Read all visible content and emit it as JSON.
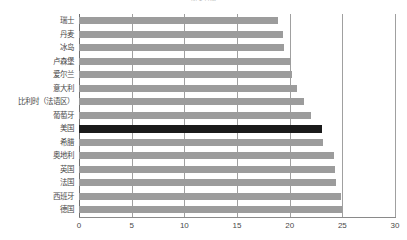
{
  "chart_data": {
    "type": "bar",
    "orientation": "horizontal",
    "title": "图 1 各国",
    "xlabel": "",
    "ylabel": "",
    "xlim": [
      0,
      30
    ],
    "ylim": null,
    "grid": true,
    "legend": null,
    "xticks": [
      0,
      5,
      10,
      15,
      20,
      25,
      30
    ],
    "xtick_labels": [
      "0",
      "5",
      "10",
      "15",
      "20",
      "25",
      "30"
    ],
    "categories": [
      "瑞士",
      "丹麦",
      "冰岛",
      "卢森堡",
      "爱尔兰",
      "意大利",
      "比利时（法语区）",
      "葡萄牙",
      "美国",
      "希腊",
      "奥地利",
      "英国",
      "法国",
      "西班牙",
      "德国"
    ],
    "values": [
      18.9,
      19.4,
      19.5,
      20.1,
      20.2,
      20.7,
      21.4,
      22.0,
      23.1,
      23.2,
      24.2,
      24.3,
      24.4,
      24.9,
      25.0
    ],
    "highlight_index": 8,
    "highlight_category": "美国",
    "colors": {
      "bar": "#9c9c9c",
      "highlight_bar": "#1a1a1a",
      "gridline": "#a0a0a0",
      "axis": "#707070",
      "text": "#4a4a4a",
      "background": "#ffffff"
    }
  }
}
